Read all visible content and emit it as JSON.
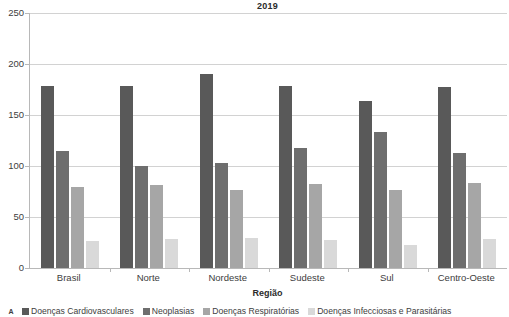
{
  "chart_data": {
    "type": "bar",
    "title": "2019",
    "xlabel": "Região",
    "ylabel": "",
    "ylim": [
      0,
      250
    ],
    "yticks": [
      0,
      50,
      100,
      150,
      200,
      250
    ],
    "grid": true,
    "legend_position": "bottom",
    "categories": [
      "Brasil",
      "Norte",
      "Nordeste",
      "Sudeste",
      "Sul",
      "Centro-Oeste"
    ],
    "series": [
      {
        "name": "Doenças Cardiovasculares",
        "color": "#595959",
        "values": [
          178,
          178,
          190,
          178,
          164,
          177
        ]
      },
      {
        "name": "Neoplasias",
        "color": "#6e6e6e",
        "values": [
          115,
          100,
          103,
          118,
          133,
          113
        ]
      },
      {
        "name": "Doenças Respiratórias",
        "color": "#a6a6a6",
        "values": [
          79,
          81,
          76,
          82,
          76,
          83
        ]
      },
      {
        "name": "Doenças Infecciosas e Parasitárias",
        "color": "#d9d9d9",
        "values": [
          26,
          28,
          29,
          27,
          23,
          28
        ]
      }
    ]
  },
  "legend": {
    "corner_marker": "A"
  },
  "colors": {
    "axis": "#b8b8b8",
    "grid": "#d2d2d2",
    "text": "#3d3d3d",
    "title": "#2b2b2b",
    "background": "#ffffff"
  }
}
